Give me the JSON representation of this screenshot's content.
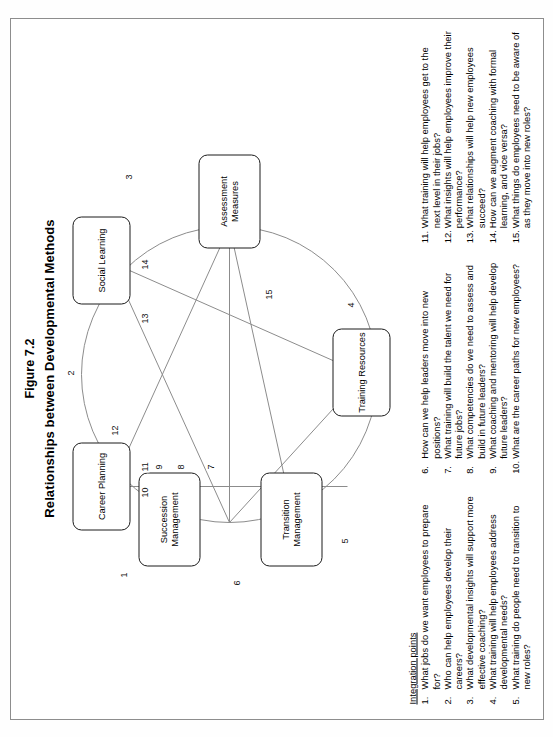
{
  "figure": {
    "number_label": "Figure 7.2",
    "title": "Relationships between Developmental Methods"
  },
  "diagram": {
    "nodes": [
      {
        "id": "career-planning",
        "label": "Career Planning"
      },
      {
        "id": "social-learning",
        "label": "Social Learning"
      },
      {
        "id": "assessment-measures",
        "label": "Assessment Measures"
      },
      {
        "id": "training-resources",
        "label": "Training Resources"
      },
      {
        "id": "transition-management",
        "label": "Transition Management"
      },
      {
        "id": "succession-management",
        "label": "Succession Management"
      }
    ],
    "edge_labels": [
      "1",
      "2",
      "3",
      "4",
      "5",
      "6",
      "7",
      "8",
      "9",
      "10",
      "11",
      "12",
      "13",
      "14",
      "15"
    ]
  },
  "integration_points": {
    "heading": "Integration points",
    "items": [
      {
        "num": "1.",
        "text": "What jobs do we want employees to prepare for?"
      },
      {
        "num": "2.",
        "text": "Who can help employees develop their careers?"
      },
      {
        "num": "3.",
        "text": "What developmental insights will support more effective coaching?"
      },
      {
        "num": "4.",
        "text": "What training will help employees address developmental needs?"
      },
      {
        "num": "5.",
        "text": "What training do people need to transition to new roles?"
      },
      {
        "num": "6.",
        "text": "How can we help leaders move into new positions?"
      },
      {
        "num": "7.",
        "text": "What training will build the talent we need for future jobs?"
      },
      {
        "num": "8.",
        "text": "What competencies do we need to assess and build in future leaders?"
      },
      {
        "num": "9.",
        "text": "What coaching and mentoring will help develop future leaders?"
      },
      {
        "num": "10.",
        "text": "What are the career paths for new employees?"
      },
      {
        "num": "11.",
        "text": "What training will help employees get to the next level in their jobs?"
      },
      {
        "num": "12.",
        "text": "What insights will help employees improve their performance?"
      },
      {
        "num": "13.",
        "text": "What relationships will help new employees succeed?"
      },
      {
        "num": "14.",
        "text": "How can we augment coaching with formal learning, and vice versa?"
      },
      {
        "num": "15.",
        "text": "What things do employees need to be aware of as they move into new roles?"
      }
    ]
  }
}
